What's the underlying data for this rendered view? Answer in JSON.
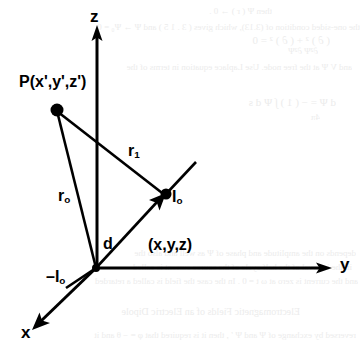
{
  "figure": {
    "type": "coordinate-diagram",
    "background_color": "#ffffff",
    "stroke_color": "#000000"
  },
  "axes": {
    "x_label": "x",
    "y_label": "y",
    "z_label": "z",
    "origin_label": "(x,y,z)"
  },
  "points": {
    "source_point_label": "P(x',y',z')",
    "field_point_label": "I",
    "field_point_subscript": "o",
    "image_point_label": "–I",
    "image_point_subscript": "o"
  },
  "vectors": {
    "r_zero_label": "r",
    "r_zero_subscript": "o",
    "r_one_label": "r",
    "r_one_subscript": "1",
    "distance_label": "d"
  },
  "bleed_text": {
    "lines": [
      {
        "text": "then Ψ ( r ) → 0 .",
        "x": 272,
        "y": 6,
        "size": 9
      },
      {
        "text": "the one-sided condition of (3.13), which gives ( 3 . 1 5 ) and Ψ → Ψ₀ = 0",
        "x": 360,
        "y": 22,
        "size": 9
      },
      {
        "text": "and V Ψ at the free node. Use Laplace equation in terms of the",
        "x": 352,
        "y": 62,
        "size": 9
      },
      {
        "text": "( ∂ ) ² + ( ∂ ) ² = 0",
        "x": 330,
        "y": 34,
        "size": 11
      },
      {
        "text": "∂²Ψ ∂²Ψ",
        "x": 318,
        "y": 46,
        "size": 9
      },
      {
        "text": "d Ψ = − ( 1 ) ∫ Ψ d s",
        "x": 336,
        "y": 96,
        "size": 11
      },
      {
        "text": "4π",
        "x": 320,
        "y": 112,
        "size": 9
      },
      {
        "text": "depends on the amplitude and phase of Ψ as well and also the",
        "x": 356,
        "y": 248,
        "size": 9
      },
      {
        "text": "in the interval of the half cycle of the source current is called",
        "x": 352,
        "y": 262,
        "size": 9
      },
      {
        "text": "and the current is zero at ω t = 0 . In the case the field is called a retarded",
        "x": 358,
        "y": 276,
        "size": 9
      },
      {
        "text": "Electromagnetic Fields of an Electric Dipole",
        "x": 300,
        "y": 306,
        "size": 10
      },
      {
        "text": "reversed by exchange of Ψ and Ψ ′ , then it is required that φ = − θ and it",
        "x": 356,
        "y": 330,
        "size": 9
      }
    ]
  },
  "geometry": {
    "origin": [
      96,
      268
    ],
    "z_axis_top": [
      97,
      28
    ],
    "y_axis_end": [
      330,
      268
    ],
    "x_axis_end": [
      33,
      330
    ],
    "p_point": [
      57,
      110
    ],
    "i_point": [
      165,
      195
    ],
    "slant_line_end": [
      196,
      163
    ]
  }
}
